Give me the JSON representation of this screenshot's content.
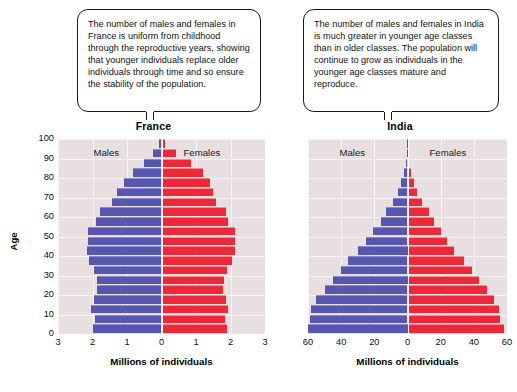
{
  "callouts": {
    "france": "The number of males and females in France is uniform from childhood through the reproductive years, showing that younger individuals replace older individuals through time and so ensure the stability of the population.",
    "india": "The number of males and females in India is much greater in younger age classes than in older classes. The population will continue to grow as individuals in the younger age classes mature and reproduce."
  },
  "colors": {
    "male": "#5757b0",
    "female": "#ed2839",
    "plot_background": "#e8e0e0",
    "gridline": "#f7f3f3"
  },
  "chart_data": [
    {
      "type": "bar",
      "title": "France",
      "subtype": "population-pyramid",
      "xlabel": "Millions of individuals",
      "ylabel": "Age",
      "xlim": [
        -3,
        3
      ],
      "xticks": [
        3,
        2,
        1,
        0,
        1,
        2,
        3
      ],
      "xtick_values": [
        -3,
        -2,
        -1,
        0,
        1,
        2,
        3
      ],
      "ylim": [
        0,
        100
      ],
      "yticks": [
        0,
        10,
        20,
        30,
        40,
        50,
        60,
        70,
        80,
        90,
        100
      ],
      "grid": true,
      "legend_position": "inside-top",
      "categories": [
        "0-4",
        "5-9",
        "10-14",
        "15-19",
        "20-24",
        "25-29",
        "30-34",
        "35-39",
        "40-44",
        "45-49",
        "50-54",
        "55-59",
        "60-64",
        "65-69",
        "70-74",
        "75-79",
        "80-84",
        "85-89",
        "90-94",
        "95-99"
      ],
      "series": [
        {
          "name": "Males",
          "color": "#5757b0",
          "values": [
            1.98,
            1.93,
            2.03,
            1.95,
            1.86,
            1.88,
            1.95,
            2.1,
            2.15,
            2.14,
            2.12,
            1.9,
            1.77,
            1.44,
            1.28,
            1.1,
            0.82,
            0.52,
            0.24,
            0.06
          ]
        },
        {
          "name": "Females",
          "color": "#ed2839",
          "values": [
            1.89,
            1.84,
            1.94,
            1.86,
            1.78,
            1.81,
            1.9,
            2.05,
            2.12,
            2.14,
            2.14,
            1.94,
            1.86,
            1.57,
            1.48,
            1.42,
            1.2,
            0.85,
            0.42,
            0.1
          ]
        }
      ]
    },
    {
      "type": "bar",
      "title": "India",
      "subtype": "population-pyramid",
      "xlabel": "Millions of individuals",
      "ylabel": "Age",
      "xlim": [
        -60,
        60
      ],
      "xticks": [
        60,
        40,
        20,
        0,
        20,
        40,
        60
      ],
      "xtick_values": [
        -60,
        -40,
        -20,
        0,
        20,
        40,
        60
      ],
      "ylim": [
        0,
        100
      ],
      "yticks": [
        0,
        10,
        20,
        30,
        40,
        50,
        60,
        70,
        80,
        90,
        100
      ],
      "grid": true,
      "legend_position": "inside-top",
      "categories": [
        "0-4",
        "5-9",
        "10-14",
        "15-19",
        "20-24",
        "25-29",
        "30-34",
        "35-39",
        "40-44",
        "45-49",
        "50-54",
        "55-59",
        "60-64",
        "65-69",
        "70-74",
        "75-79",
        "80-84",
        "85-89",
        "90-94",
        "95-99"
      ],
      "series": [
        {
          "name": "Males",
          "color": "#5757b0",
          "values": [
            61,
            59,
            58,
            55,
            50,
            45,
            40,
            36,
            30,
            25,
            21,
            16,
            13,
            9,
            6,
            4,
            2.2,
            1.0,
            0.4,
            0.1
          ]
        },
        {
          "name": "Females",
          "color": "#ed2839",
          "values": [
            58,
            56,
            55,
            52,
            48,
            43,
            39,
            34,
            28,
            24,
            20,
            16,
            13,
            9,
            6,
            4,
            2.4,
            1.1,
            0.4,
            0.1
          ]
        }
      ]
    }
  ]
}
